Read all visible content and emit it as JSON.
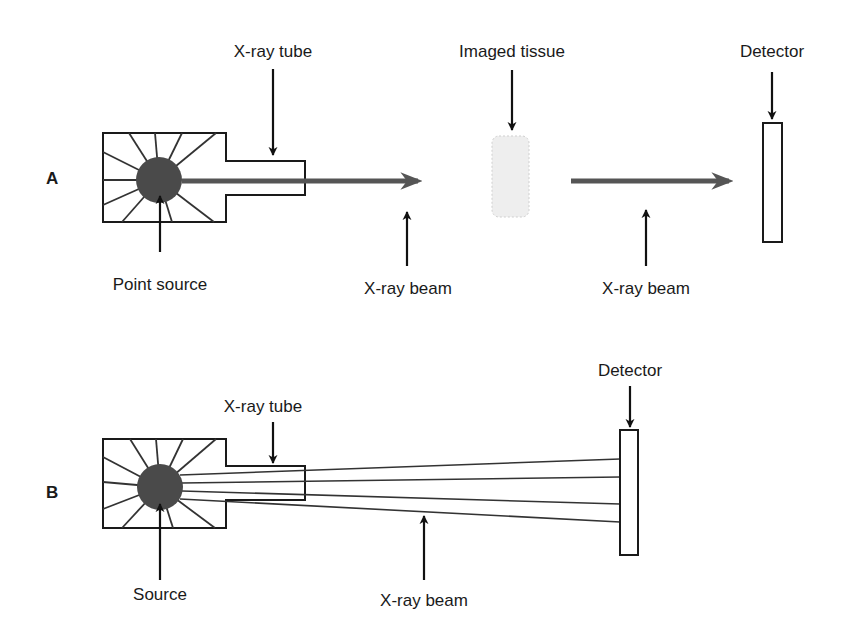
{
  "diagram": {
    "panels": [
      {
        "id": "A",
        "label": "A",
        "callouts": {
          "tube": "X-ray tube",
          "tissue": "Imaged tissue",
          "detector": "Detector",
          "source": "Point source",
          "beam_1": "X-ray beam",
          "beam_2": "X-ray beam"
        },
        "components": [
          "X-ray tube",
          "Point source",
          "X-ray beam",
          "Imaged tissue",
          "X-ray beam",
          "Detector"
        ]
      },
      {
        "id": "B",
        "label": "B",
        "callouts": {
          "tube": "X-ray tube",
          "detector": "Detector",
          "source": "Source",
          "beam": "X-ray beam"
        },
        "ray_count": 4,
        "components": [
          "X-ray tube",
          "Source",
          "X-ray beam",
          "Detector"
        ]
      }
    ],
    "colors": {
      "outline": "#1a1a1a",
      "source_fill": "#4a4a4a",
      "beam": "#555555",
      "tissue_fill": "#eeeeee",
      "background": "#ffffff"
    }
  }
}
